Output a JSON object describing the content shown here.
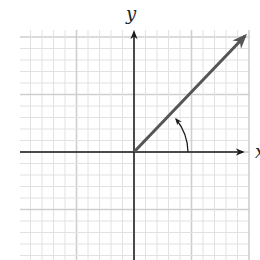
{
  "diagram": {
    "type": "coordinate-plane-angle",
    "axes": {
      "x_label": "x",
      "y_label": "y"
    },
    "origin_px": [
      134,
      152
    ],
    "grid": {
      "left": 20,
      "top": 30,
      "right": 250,
      "bottom": 260,
      "cell": 11.5,
      "minor_color": "#e2e2e2",
      "major_color": "#cfcfcf",
      "major_every": 5
    },
    "ray": {
      "from": [
        134,
        152
      ],
      "to": [
        246,
        35
      ],
      "color": "#555555"
    },
    "angle_arc": {
      "radius": 50,
      "start_deg": 0,
      "end_deg": 45,
      "direction": "counterclockwise"
    },
    "colors": {
      "axis": "#1a1a1a",
      "ray": "#555555"
    }
  }
}
